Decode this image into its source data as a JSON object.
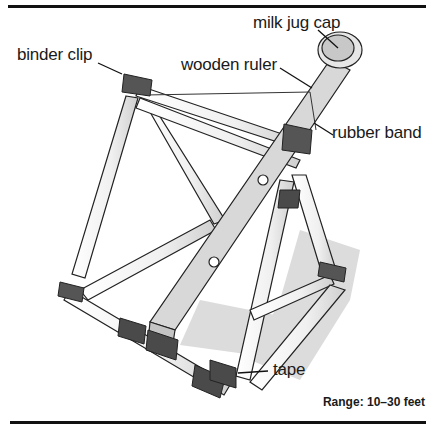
{
  "diagram": {
    "labels": [
      {
        "id": "milk-jug-cap",
        "text": "milk jug cap"
      },
      {
        "id": "binder-clip",
        "text": "binder clip"
      },
      {
        "id": "wooden-ruler",
        "text": "wooden ruler"
      },
      {
        "id": "rubber-band",
        "text": "rubber band"
      },
      {
        "id": "tape",
        "text": "tape"
      }
    ],
    "caption": "Range: 10–30 feet"
  },
  "colors": {
    "rule": "#111111",
    "outline": "#222222",
    "tube": "#f2f2f2",
    "ruler": "#d4d4d4",
    "clip": "#555555",
    "tape": "#4a4a4a",
    "shadow": "#cfcfcf",
    "background": "#ffffff"
  }
}
